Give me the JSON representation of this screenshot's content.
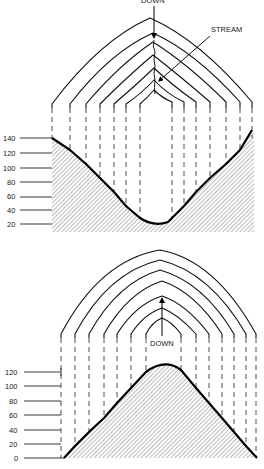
{
  "top_figure": {
    "title": "Valley (stream) contour map and profile",
    "labels": {
      "flow_arrow_label": "DOWN",
      "stream_label": "STREAM"
    },
    "elevation_axis": [
      "140",
      "120",
      "100",
      "80",
      "60",
      "40",
      "20"
    ],
    "contour_count": 7
  },
  "bottom_figure": {
    "title": "Ridge contour map and profile",
    "labels": {
      "flow_arrow_label": "DOWN"
    },
    "elevation_axis": [
      "120",
      "100",
      "80",
      "60",
      "40",
      "20",
      "0"
    ],
    "contour_count": 7
  },
  "colors": {
    "ink": "#000000",
    "background": "#ffffff"
  }
}
